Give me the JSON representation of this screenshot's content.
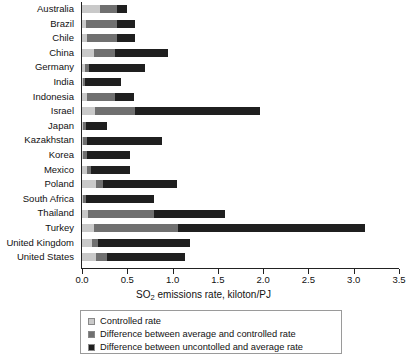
{
  "chart_data": {
    "type": "bar",
    "orientation": "horizontal",
    "stacked": true,
    "title": "",
    "xlabel": "SO2 emissions rate, kiloton/PJ",
    "xlabel_parts": {
      "pre": "SO",
      "sub": "2",
      "post": " emissions rate, kiloton/PJ"
    },
    "ylabel": "",
    "xlim": [
      0.0,
      3.5
    ],
    "xticks": [
      0.0,
      0.5,
      1.0,
      1.5,
      2.0,
      2.5,
      3.0,
      3.5
    ],
    "xticklabels": [
      "0.0",
      "0.5",
      "1.0",
      "1.5",
      "2.0",
      "2.5",
      "3.0",
      "3.5"
    ],
    "grid": false,
    "legend_position": "below-axis-center",
    "categories": [
      "Australia",
      "Brazil",
      "Chile",
      "China",
      "Germany",
      "India",
      "Indonesia",
      "Israel",
      "Japan",
      "Kazakhstan",
      "Korea",
      "Mexico",
      "Poland",
      "South Africa",
      "Thailand",
      "Turkey",
      "United Kingdom",
      "United States"
    ],
    "series": [
      {
        "name": "Controlled rate",
        "color": "#c9c9c9",
        "values": [
          0.2,
          0.04,
          0.05,
          0.13,
          0.03,
          0.01,
          0.05,
          0.14,
          0.01,
          0.01,
          0.01,
          0.05,
          0.15,
          0.01,
          0.07,
          0.13,
          0.11,
          0.16
        ]
      },
      {
        "name": "Difference between average and controlled rate",
        "color": "#707070",
        "values": [
          0.19,
          0.35,
          0.34,
          0.23,
          0.05,
          0.02,
          0.31,
          0.45,
          0.03,
          0.04,
          0.04,
          0.05,
          0.08,
          0.03,
          0.72,
          0.93,
          0.07,
          0.12
        ]
      },
      {
        "name": "Difference between uncontolled and average rate",
        "color": "#1f1f1f",
        "values": [
          0.11,
          0.2,
          0.2,
          0.59,
          0.62,
          0.4,
          0.21,
          1.37,
          0.24,
          0.83,
          0.48,
          0.43,
          0.82,
          0.76,
          0.79,
          2.06,
          1.01,
          0.86
        ]
      }
    ],
    "totals": [
      0.5,
      0.59,
      0.59,
      0.95,
      0.7,
      0.43,
      0.57,
      1.96,
      0.28,
      0.88,
      0.53,
      0.53,
      1.05,
      0.8,
      1.58,
      3.12,
      1.19,
      1.14
    ]
  },
  "legend": {
    "items": [
      {
        "label": "Controlled rate",
        "color": "#c9c9c9"
      },
      {
        "label": "Difference between average and controlled rate",
        "color": "#707070"
      },
      {
        "label": "Difference between uncontolled and average rate",
        "color": "#1f1f1f"
      }
    ]
  }
}
